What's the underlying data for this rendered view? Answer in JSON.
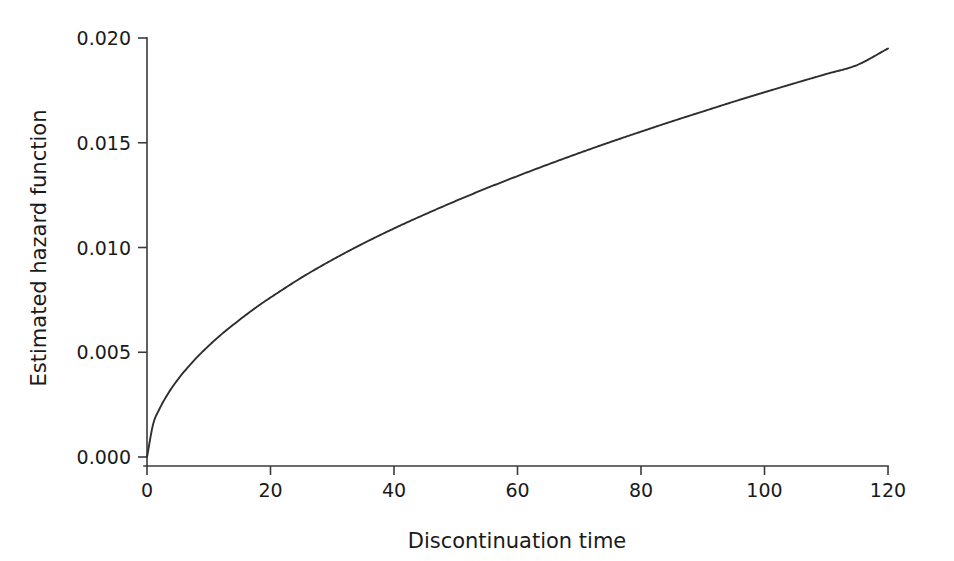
{
  "chart_data": {
    "type": "line",
    "title": "",
    "subtitle": "",
    "xlabel": "Discontinuation time",
    "ylabel": "Estimated hazard function",
    "xlim": [
      0,
      120
    ],
    "ylim": [
      0.0,
      0.02
    ],
    "xticks": [
      0,
      20,
      40,
      60,
      80,
      100,
      120
    ],
    "xtick_labels": [
      "0",
      "20",
      "40",
      "60",
      "80",
      "100",
      "120"
    ],
    "yticks": [
      0.0,
      0.005,
      0.01,
      0.015,
      0.02
    ],
    "ytick_labels": [
      "0.000",
      "0.005",
      "0.010",
      "0.015",
      "0.020"
    ],
    "grid": false,
    "legend": null,
    "legend_position": "none",
    "annotations": [],
    "line_color": "#2e2e2e",
    "background_color": "#ffffff",
    "axis_color": "#3a3a3a",
    "series": [
      {
        "name": "Estimated hazard function",
        "x": [
          0,
          1,
          2,
          3,
          4,
          5,
          6,
          8,
          10,
          12,
          15,
          18,
          20,
          25,
          30,
          35,
          40,
          45,
          50,
          55,
          60,
          65,
          70,
          75,
          80,
          85,
          90,
          95,
          100,
          105,
          110,
          115,
          120
        ],
        "values": [
          0.0,
          0.00158,
          0.00228,
          0.00283,
          0.00329,
          0.0037,
          0.00407,
          0.00473,
          0.00531,
          0.00584,
          0.00655,
          0.00721,
          0.00761,
          0.00856,
          0.00941,
          0.01019,
          0.01091,
          0.01158,
          0.01222,
          0.01283,
          0.01341,
          0.01397,
          0.01451,
          0.01503,
          0.01553,
          0.01602,
          0.01649,
          0.01696,
          0.01741,
          0.01785,
          0.01828,
          0.01871,
          0.0195
        ]
      }
    ]
  },
  "figure": {
    "x_axis_title": "Discontinuation time",
    "y_axis_title": "Estimated hazard function"
  }
}
